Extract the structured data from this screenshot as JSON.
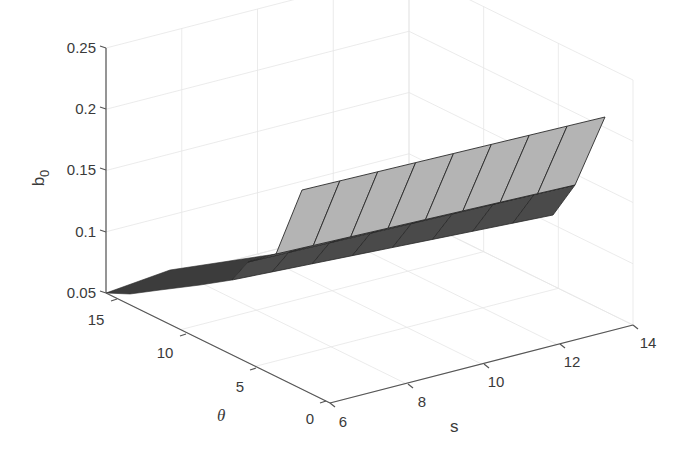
{
  "chart_data": {
    "type": "surface3d",
    "title": "",
    "xlabel": "s",
    "ylabel": "θ",
    "zlabel": "b0",
    "zlabel_main": "b",
    "zlabel_sub": "0",
    "x_ticks": [
      "6",
      "8",
      "10",
      "12",
      "14"
    ],
    "y_ticks": [
      "0",
      "5",
      "10",
      "15"
    ],
    "z_ticks": [
      "0.05",
      "0.1",
      "0.15",
      "0.2",
      "0.25"
    ],
    "xlim": [
      6,
      14
    ],
    "ylim": [
      0,
      15
    ],
    "zlim": [
      0.05,
      0.25
    ],
    "grid": true,
    "colormap": "gray",
    "surface_description": "b0 stays near 0.05 for low s and high θ; jumps to roughly 0.15–0.2 plateau at low θ, rising slightly with s",
    "surface_samples": {
      "s": [
        6,
        7,
        8,
        9,
        10,
        11,
        12,
        13,
        14
      ],
      "theta_low_plateau_b0": [
        0.16,
        0.165,
        0.17,
        0.175,
        0.18,
        0.185,
        0.19,
        0.195,
        0.2
      ],
      "theta_high_floor_b0": [
        0.05,
        0.055,
        0.06,
        0.065,
        0.07,
        0.075,
        0.08,
        0.085,
        0.09
      ]
    },
    "colors": {
      "plateau_face": "#b4b4b4",
      "mid_face": "#6e6e6e",
      "floor_face": "#3c3c3c",
      "mesh_edge": "#2a2a2a"
    }
  },
  "axes": {
    "z": {
      "x": 106,
      "top_y": 48,
      "bottom_y": 293,
      "ticks": [
        {
          "label": "0.25",
          "y": 48
        },
        {
          "label": "0.2",
          "y": 109
        },
        {
          "label": "0.15",
          "y": 170
        },
        {
          "label": "0.1",
          "y": 232
        },
        {
          "label": "0.05",
          "y": 293
        }
      ]
    },
    "theta": {
      "start": [
        106,
        293
      ],
      "end": [
        330,
        403
      ],
      "ticks": [
        {
          "label": "15",
          "x": 117,
          "y": 299,
          "lx": 96,
          "ly": 325
        },
        {
          "label": "10",
          "x": 186,
          "y": 334,
          "lx": 165,
          "ly": 358
        },
        {
          "label": "5",
          "x": 256,
          "y": 368,
          "lx": 240,
          "ly": 392
        },
        {
          "label": "0",
          "x": 326,
          "y": 401,
          "lx": 310,
          "ly": 424
        }
      ]
    },
    "s": {
      "start": [
        330,
        403
      ],
      "end": [
        633,
        325
      ],
      "ticks": [
        {
          "label": "6",
          "x": 330,
          "y": 403,
          "lx": 343,
          "ly": 427
        },
        {
          "label": "8",
          "x": 408,
          "y": 384,
          "lx": 422,
          "ly": 407
        },
        {
          "label": "10",
          "x": 484,
          "y": 364,
          "lx": 496,
          "ly": 387
        },
        {
          "label": "12",
          "x": 560,
          "y": 344,
          "lx": 572,
          "ly": 367
        },
        {
          "label": "14",
          "x": 633,
          "y": 325,
          "lx": 648,
          "ly": 348
        }
      ]
    }
  },
  "labels": {
    "z": {
      "x": 44,
      "y": 178
    },
    "theta": {
      "x": 217,
      "y": 421
    },
    "s": {
      "x": 450,
      "y": 432
    }
  }
}
